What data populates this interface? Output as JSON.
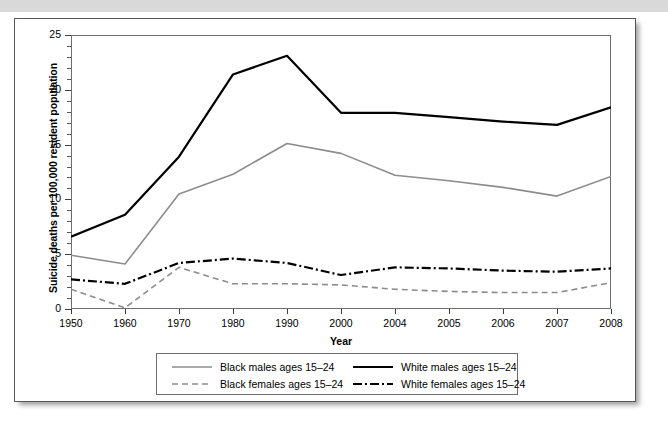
{
  "figure": {
    "panel_name": "chart-figure-panel"
  },
  "chart_data": {
    "type": "line",
    "title": "",
    "xlabel": "Year",
    "ylabel": "Suicide deaths per 100,000 resident population",
    "categories": [
      "1950",
      "1960",
      "1970",
      "1980",
      "1990",
      "2000",
      "2004",
      "2005",
      "2006",
      "2007",
      "2008"
    ],
    "ylim": [
      0,
      25
    ],
    "yticks": [
      0,
      5,
      10,
      15,
      20,
      25
    ],
    "ytick_labels": [
      "0",
      "5",
      "10",
      "15",
      "20",
      "25"
    ],
    "y_minor_tick_step": 1,
    "grid": false,
    "legend_position": "bottom-center",
    "series": [
      {
        "name": "Black males ages 15–24",
        "style": "solid",
        "color": "#8c8c8e",
        "width": 1.6,
        "values": [
          4.9,
          4.1,
          10.5,
          12.3,
          15.1,
          14.2,
          12.2,
          11.7,
          11.1,
          10.3,
          12.1
        ]
      },
      {
        "name": "White males ages 15–24",
        "style": "solid",
        "color": "#000000",
        "width": 2.2,
        "values": [
          6.6,
          8.6,
          13.9,
          21.4,
          23.1,
          17.9,
          17.9,
          17.5,
          17.1,
          16.8,
          18.4
        ]
      },
      {
        "name": "Black females ages 15–24",
        "style": "dashed",
        "color": "#8c8c8e",
        "width": 1.6,
        "values": [
          1.8,
          0.1,
          3.8,
          2.3,
          2.3,
          2.2,
          1.8,
          1.6,
          1.5,
          1.5,
          2.4
        ]
      },
      {
        "name": "White females ages 15–24",
        "style": "dash-dot",
        "color": "#000000",
        "width": 2.2,
        "values": [
          2.7,
          2.3,
          4.2,
          4.6,
          4.2,
          3.1,
          3.8,
          3.7,
          3.5,
          3.4,
          3.7
        ]
      }
    ]
  },
  "legend": {
    "entries": [
      {
        "label": "Black males ages 15–24",
        "series_index": 0
      },
      {
        "label": "White males ages 15–24",
        "series_index": 1
      },
      {
        "label": "Black females ages 15–24",
        "series_index": 2
      },
      {
        "label": "White females ages 15–24",
        "series_index": 3
      }
    ]
  }
}
